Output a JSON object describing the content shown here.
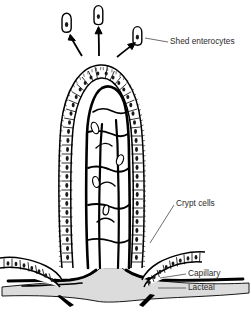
{
  "figure": {
    "background_color": "#ffffff",
    "ink_color": "#000000",
    "fill_gray": "#dcdcdc",
    "label_color": "#2b2b2b"
  },
  "labels": {
    "shed_enterocytes": "Shed enterocytes",
    "crypt_cells": "Crypt cells",
    "capillary": "Capillary",
    "lacteal": "Lacteal"
  },
  "structures": {
    "villus": "villus",
    "epithelium": "columnar-epithelium",
    "brush_border": "microvilli-brush-border",
    "lacteal_vessel": "central-lacteal",
    "capillary_network": "capillary-network",
    "crypt_left": "crypt-of-lieberkuhn-left",
    "crypt_right": "crypt-of-lieberkuhn-right",
    "submucosa": "submucosa",
    "shed_cells": [
      "shed-cell-1",
      "shed-cell-2",
      "shed-cell-3"
    ],
    "shed_arrows": [
      "shed-arrow-1",
      "shed-arrow-2",
      "shed-arrow-3"
    ],
    "vessel_stubs": [
      "vessel-stub-left",
      "vessel-stub-right"
    ]
  }
}
